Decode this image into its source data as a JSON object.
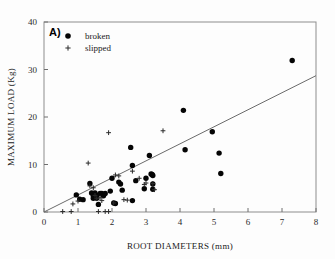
{
  "figure": {
    "panel_label": "A)",
    "background_color": "#fdfdfd",
    "frame_color": "#8d8d8d"
  },
  "chart_data": {
    "type": "scatter",
    "title": "",
    "xlabel": "ROOT DIAMETERS (mm)",
    "ylabel": "MAXIMUM LOAD (Kg)",
    "xlim": [
      0,
      8
    ],
    "ylim": [
      0,
      40
    ],
    "xticks": [
      0,
      1,
      2,
      3,
      4,
      5,
      6,
      7,
      8
    ],
    "yticks": [
      0,
      10,
      20,
      30,
      40
    ],
    "xticklabels": [
      "0",
      "1",
      "2",
      "3",
      "4",
      "5",
      "6",
      "7",
      "8"
    ],
    "yticklabels": [
      "0",
      "10",
      "20",
      "30",
      "40"
    ],
    "grid": false,
    "legend_position": "top-left",
    "marker_colors": {
      "broken": "#050505",
      "slipped": "#2a2a2a",
      "trendline": "#6b6b6b"
    },
    "trendline": {
      "label": "",
      "x": [
        0,
        8
      ],
      "y": [
        0,
        28.7
      ],
      "intercept": 0,
      "slope": 3.59
    },
    "series": [
      {
        "name": "broken",
        "marker": "filled-circle",
        "points": [
          [
            0.95,
            3.6
          ],
          [
            1.05,
            2.7
          ],
          [
            1.15,
            2.6
          ],
          [
            1.35,
            6.0
          ],
          [
            1.4,
            4.0
          ],
          [
            1.45,
            3.4
          ],
          [
            1.45,
            2.9
          ],
          [
            1.5,
            4.0
          ],
          [
            1.55,
            3.5
          ],
          [
            1.55,
            2.9
          ],
          [
            1.6,
            1.6
          ],
          [
            1.65,
            3.9
          ],
          [
            1.7,
            3.9
          ],
          [
            1.75,
            3.4
          ],
          [
            1.8,
            3.9
          ],
          [
            1.95,
            4.4
          ],
          [
            2.0,
            7.1
          ],
          [
            2.05,
            1.9
          ],
          [
            2.1,
            1.8
          ],
          [
            2.2,
            6.3
          ],
          [
            2.25,
            5.9
          ],
          [
            2.3,
            4.6
          ],
          [
            2.55,
            13.6
          ],
          [
            2.6,
            9.8
          ],
          [
            2.6,
            2.4
          ],
          [
            2.7,
            6.6
          ],
          [
            2.95,
            4.9
          ],
          [
            3.0,
            7.1
          ],
          [
            3.1,
            11.9
          ],
          [
            3.15,
            8.0
          ],
          [
            3.18,
            7.9
          ],
          [
            3.2,
            7.7
          ],
          [
            3.2,
            5.9
          ],
          [
            3.2,
            4.8
          ],
          [
            4.1,
            21.4
          ],
          [
            4.15,
            13.1
          ],
          [
            4.95,
            16.9
          ],
          [
            5.15,
            12.4
          ],
          [
            5.2,
            8.1
          ],
          [
            7.3,
            31.9
          ]
        ]
      },
      {
        "name": "slipped",
        "marker": "plus",
        "points": [
          [
            0.55,
            0.1
          ],
          [
            0.8,
            0.1
          ],
          [
            0.85,
            1.7
          ],
          [
            1.0,
            2.3
          ],
          [
            1.3,
            10.3
          ],
          [
            1.35,
            5.5
          ],
          [
            1.45,
            5.1
          ],
          [
            1.5,
            3.5
          ],
          [
            1.55,
            2.8
          ],
          [
            1.6,
            0.1
          ],
          [
            1.65,
            3.0
          ],
          [
            1.7,
            2.4
          ],
          [
            1.8,
            0.1
          ],
          [
            1.9,
            0.1
          ],
          [
            1.9,
            16.7
          ],
          [
            2.05,
            1.9
          ],
          [
            2.1,
            7.8
          ],
          [
            2.2,
            7.6
          ],
          [
            2.35,
            2.6
          ],
          [
            2.45,
            2.5
          ],
          [
            2.6,
            8.6
          ],
          [
            2.8,
            7.1
          ],
          [
            2.95,
            5.8
          ],
          [
            3.0,
            6.1
          ],
          [
            3.2,
            6.0
          ],
          [
            3.25,
            4.7
          ],
          [
            3.5,
            17.1
          ]
        ]
      }
    ]
  },
  "legend": {
    "items": [
      {
        "label": "broken",
        "marker": "filled-circle"
      },
      {
        "label": "slipped",
        "marker": "plus"
      }
    ]
  }
}
